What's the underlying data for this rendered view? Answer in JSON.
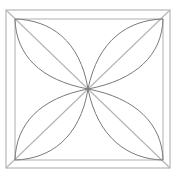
{
  "diagram": {
    "title": "",
    "colors": {
      "background": "#ffffff",
      "square_stroke": "#a8a8a8",
      "diagonal_stroke": "#b4b4b4",
      "petal_stroke": "#7a7a7a"
    },
    "outer_square": {
      "x": 6,
      "y": 10,
      "w": 164,
      "h": 158
    },
    "inner_square": {
      "x": 15,
      "y": 19,
      "w": 148,
      "h": 141
    },
    "center": {
      "x": 88,
      "y": 89
    },
    "petals": [
      {
        "name": "top-left",
        "tip": [
          15,
          19
        ]
      },
      {
        "name": "top-right",
        "tip": [
          163,
          19
        ]
      },
      {
        "name": "bottom-right",
        "tip": [
          163,
          160
        ]
      },
      {
        "name": "bottom-left",
        "tip": [
          15,
          160
        ]
      }
    ]
  }
}
